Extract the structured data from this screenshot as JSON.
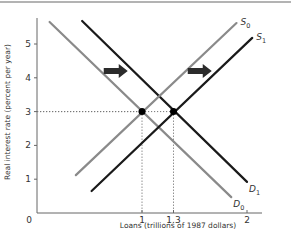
{
  "chart_data": {
    "type": "line",
    "title": "",
    "xlabel": "Loans (trillions of 1987 dollars)",
    "ylabel": "Real interest rate (percent per year)",
    "xlim": [
      0,
      2.2
    ],
    "ylim": [
      0,
      6
    ],
    "x_ticks": [
      {
        "value": 0,
        "label": "0"
      },
      {
        "value": 1,
        "label": "1"
      },
      {
        "value": 1.3,
        "label": "1.3"
      },
      {
        "value": 2,
        "label": "2"
      }
    ],
    "y_ticks": [
      {
        "value": 1,
        "label": "1"
      },
      {
        "value": 2,
        "label": "2"
      },
      {
        "value": 3,
        "label": "3"
      },
      {
        "value": 4,
        "label": "4"
      },
      {
        "value": 5,
        "label": "5"
      }
    ],
    "grid": false,
    "series": [
      {
        "name": "D0",
        "label_main": "D",
        "label_sub": "0",
        "color": "#8a8a8a",
        "points": [
          [
            0.12,
            5.65
          ],
          [
            1.85,
            0.47
          ]
        ]
      },
      {
        "name": "D1",
        "label_main": "D",
        "label_sub": "1",
        "color": "#1a1a1a",
        "points": [
          [
            0.43,
            5.68
          ],
          [
            2.0,
            0.92
          ]
        ]
      },
      {
        "name": "S0",
        "label_main": "S",
        "label_sub": "0",
        "color": "#8a8a8a",
        "points": [
          [
            0.37,
            1.12
          ],
          [
            1.9,
            5.62
          ]
        ]
      },
      {
        "name": "S1",
        "label_main": "S",
        "label_sub": "1",
        "color": "#1a1a1a",
        "points": [
          [
            0.52,
            0.65
          ],
          [
            2.05,
            5.18
          ]
        ]
      }
    ],
    "equilibria": [
      {
        "name": "initial-equilibrium",
        "x": 1,
        "y": 3
      },
      {
        "name": "new-equilibrium",
        "x": 1.3,
        "y": 3
      }
    ],
    "annotations": [
      {
        "name": "demand-shift-arrow",
        "type": "arrow-right",
        "x": 0.75,
        "y": 4.2
      },
      {
        "name": "supply-shift-arrow",
        "type": "arrow-right",
        "x": 1.55,
        "y": 4.2
      }
    ]
  }
}
